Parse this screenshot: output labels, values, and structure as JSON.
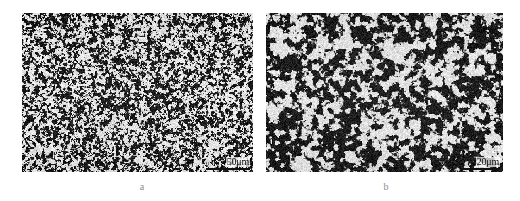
{
  "figure": {
    "background_color": "#ffffff",
    "type": "micrograph-pair",
    "panels": [
      {
        "id": "a",
        "caption": "a",
        "scalebar": {
          "label": "50μm",
          "value": 50,
          "unit": "μm",
          "position": "bottom-right",
          "bar_color": "#111111"
        },
        "texture": {
          "description": "fine-grained dark speckled microstructure on light matrix",
          "grain_scale": 2.1,
          "density": 0.52,
          "contrast": 0.95,
          "seed": 1337
        },
        "frame": {
          "x": 22,
          "y": 13,
          "width": 231,
          "height": 159
        }
      },
      {
        "id": "b",
        "caption": "b",
        "scalebar": {
          "label": "20μm",
          "value": 20,
          "unit": "μm",
          "position": "bottom-right",
          "bar_color": "#111111"
        },
        "texture": {
          "description": "coarse network-like dark phase on light matrix",
          "grain_scale": 5.4,
          "density": 0.46,
          "contrast": 0.92,
          "seed": 8821
        },
        "frame": {
          "x": 266,
          "y": 13,
          "width": 237,
          "height": 159
        }
      }
    ]
  }
}
